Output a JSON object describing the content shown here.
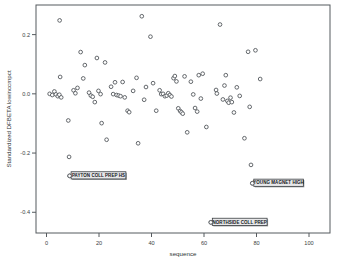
{
  "chart_data": {
    "type": "scatter",
    "title": "",
    "xlabel": "sequence",
    "ylabel": "Standardized DFBETA lowinccmpct",
    "xlim": [
      -4,
      108
    ],
    "ylim": [
      -0.47,
      0.3
    ],
    "xticks": [
      0,
      20,
      40,
      60,
      80,
      100
    ],
    "xticklabels": [
      "0",
      "20",
      "40",
      "60",
      "80",
      "100"
    ],
    "yticks": [
      0.2,
      0.0,
      -0.2,
      -0.4
    ],
    "yticklabels": [
      "0.2",
      "0.0",
      "-0.2",
      "-0.4"
    ],
    "grid": false,
    "legend": null,
    "marker": "open-circle",
    "points": [
      {
        "x": 1.2,
        "y": 0.0
      },
      {
        "x": 2.2,
        "y": -0.004
      },
      {
        "x": 3.0,
        "y": 0.008
      },
      {
        "x": 3.6,
        "y": -0.002
      },
      {
        "x": 4.3,
        "y": -0.008
      },
      {
        "x": 4.9,
        "y": -0.003
      },
      {
        "x": 5.2,
        "y": 0.057
      },
      {
        "x": 5.6,
        "y": -0.012
      },
      {
        "x": 5.0,
        "y": 0.248
      },
      {
        "x": 8.3,
        "y": -0.09
      },
      {
        "x": 8.6,
        "y": -0.213
      },
      {
        "x": 8.8,
        "y": -0.277
      },
      {
        "x": 10.3,
        "y": 0.012
      },
      {
        "x": 11.0,
        "y": 0.002
      },
      {
        "x": 11.8,
        "y": 0.02
      },
      {
        "x": 13.0,
        "y": 0.141
      },
      {
        "x": 14.0,
        "y": 0.052
      },
      {
        "x": 14.6,
        "y": 0.097
      },
      {
        "x": 16.2,
        "y": 0.004
      },
      {
        "x": 16.9,
        "y": -0.006
      },
      {
        "x": 17.6,
        "y": -0.01
      },
      {
        "x": 18.4,
        "y": -0.028
      },
      {
        "x": 19.2,
        "y": 0.121
      },
      {
        "x": 19.8,
        "y": 0.01
      },
      {
        "x": 20.6,
        "y": -0.001
      },
      {
        "x": 21.0,
        "y": -0.099
      },
      {
        "x": 22.3,
        "y": 0.106
      },
      {
        "x": 22.9,
        "y": -0.155
      },
      {
        "x": 24.6,
        "y": 0.024
      },
      {
        "x": 25.4,
        "y": -0.001
      },
      {
        "x": 26.1,
        "y": 0.039
      },
      {
        "x": 26.7,
        "y": -0.004
      },
      {
        "x": 27.5,
        "y": -0.006
      },
      {
        "x": 28.2,
        "y": -0.008
      },
      {
        "x": 29.0,
        "y": 0.04
      },
      {
        "x": 29.8,
        "y": -0.012
      },
      {
        "x": 30.9,
        "y": -0.057
      },
      {
        "x": 31.5,
        "y": -0.062
      },
      {
        "x": 33.0,
        "y": 0.01
      },
      {
        "x": 34.3,
        "y": 0.054
      },
      {
        "x": 34.9,
        "y": -0.167
      },
      {
        "x": 36.3,
        "y": 0.262
      },
      {
        "x": 37.2,
        "y": -0.02
      },
      {
        "x": 37.9,
        "y": 0.023
      },
      {
        "x": 39.6,
        "y": 0.193
      },
      {
        "x": 40.6,
        "y": 0.036
      },
      {
        "x": 41.8,
        "y": -0.057
      },
      {
        "x": 43.1,
        "y": 0.012
      },
      {
        "x": 43.7,
        "y": -0.001
      },
      {
        "x": 44.4,
        "y": 0.0
      },
      {
        "x": 45.1,
        "y": -0.008
      },
      {
        "x": 45.8,
        "y": -0.006
      },
      {
        "x": 46.4,
        "y": 0.002
      },
      {
        "x": 47.0,
        "y": -0.004
      },
      {
        "x": 47.6,
        "y": -0.009
      },
      {
        "x": 48.4,
        "y": 0.053
      },
      {
        "x": 48.9,
        "y": 0.06
      },
      {
        "x": 49.5,
        "y": 0.042
      },
      {
        "x": 50.2,
        "y": -0.049
      },
      {
        "x": 50.9,
        "y": -0.058
      },
      {
        "x": 51.4,
        "y": -0.062
      },
      {
        "x": 51.9,
        "y": -0.067
      },
      {
        "x": 52.6,
        "y": 0.059
      },
      {
        "x": 53.6,
        "y": -0.13
      },
      {
        "x": 55.0,
        "y": 0.041
      },
      {
        "x": 55.9,
        "y": -0.002
      },
      {
        "x": 56.6,
        "y": -0.048
      },
      {
        "x": 57.4,
        "y": -0.06
      },
      {
        "x": 58.0,
        "y": 0.063
      },
      {
        "x": 58.8,
        "y": -0.016
      },
      {
        "x": 59.5,
        "y": 0.068
      },
      {
        "x": 60.9,
        "y": -0.112
      },
      {
        "x": 62.6,
        "y": -0.434
      },
      {
        "x": 64.6,
        "y": 0.013
      },
      {
        "x": 64.9,
        "y": 0.001
      },
      {
        "x": 66.1,
        "y": 0.234
      },
      {
        "x": 67.2,
        "y": -0.019
      },
      {
        "x": 67.8,
        "y": 0.028
      },
      {
        "x": 68.3,
        "y": 0.063
      },
      {
        "x": 68.9,
        "y": -0.024
      },
      {
        "x": 69.4,
        "y": -0.03
      },
      {
        "x": 70.1,
        "y": -0.013
      },
      {
        "x": 70.6,
        "y": -0.028
      },
      {
        "x": 71.4,
        "y": -0.063
      },
      {
        "x": 72.5,
        "y": 0.022
      },
      {
        "x": 73.6,
        "y": -0.007
      },
      {
        "x": 75.4,
        "y": -0.15
      },
      {
        "x": 76.8,
        "y": 0.142
      },
      {
        "x": 77.4,
        "y": -0.044
      },
      {
        "x": 77.9,
        "y": -0.24
      },
      {
        "x": 78.4,
        "y": -0.302
      },
      {
        "x": 79.6,
        "y": 0.147
      },
      {
        "x": 81.4,
        "y": 0.05
      }
    ],
    "annotations": [
      {
        "id": "payton",
        "text": "PAYTON COLL PREP HS",
        "x": 8.8,
        "y": -0.277,
        "align": "right"
      },
      {
        "id": "young",
        "text": "YOUNG MAGNET HIGH",
        "x": 78.4,
        "y": -0.302,
        "align": "left"
      },
      {
        "id": "northside",
        "text": "NORTHSIDE COLL PREP",
        "x": 62.6,
        "y": -0.434,
        "align": "right"
      }
    ]
  },
  "colors": {
    "frame": "#555a5e",
    "marker_stroke": "#53585c",
    "marker_fill": "#ffffff",
    "label_box": "#e8e8ea",
    "label_border": "#3b3f42",
    "text": "#2e3234"
  }
}
